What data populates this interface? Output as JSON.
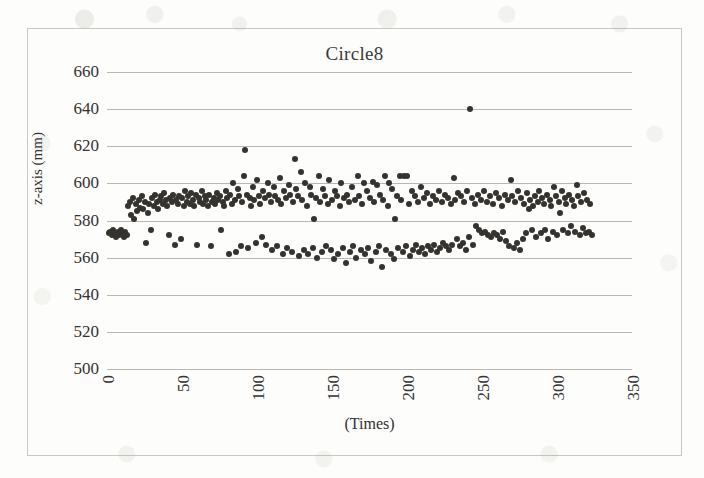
{
  "chart_data": {
    "type": "scatter",
    "title": "Circle8",
    "xlabel": "(Times)",
    "ylabel": "z-axis (mm)",
    "xlim": [
      0,
      350
    ],
    "ylim": [
      500,
      660
    ],
    "xticks": [
      0,
      50,
      100,
      150,
      200,
      250,
      300,
      350
    ],
    "yticks": [
      500,
      520,
      540,
      560,
      580,
      600,
      620,
      640,
      660
    ],
    "grid": "horizontal",
    "legend": "none",
    "marker_color": "#35332f",
    "series": [
      {
        "name": "z-axis measurement",
        "points": [
          [
            1,
            573
          ],
          [
            2,
            574
          ],
          [
            3,
            572
          ],
          [
            4,
            575
          ],
          [
            5,
            573
          ],
          [
            6,
            571
          ],
          [
            7,
            574
          ],
          [
            8,
            572
          ],
          [
            9,
            575
          ],
          [
            10,
            573
          ],
          [
            11,
            571
          ],
          [
            12,
            574
          ],
          [
            13,
            572
          ],
          [
            14,
            588
          ],
          [
            15,
            590
          ],
          [
            16,
            583
          ],
          [
            17,
            592
          ],
          [
            18,
            581
          ],
          [
            19,
            589
          ],
          [
            20,
            585
          ],
          [
            21,
            591
          ],
          [
            22,
            587
          ],
          [
            23,
            593
          ],
          [
            24,
            586
          ],
          [
            25,
            590
          ],
          [
            26,
            568
          ],
          [
            27,
            584
          ],
          [
            28,
            589
          ],
          [
            29,
            575
          ],
          [
            30,
            592
          ],
          [
            31,
            588
          ],
          [
            32,
            594
          ],
          [
            33,
            590
          ],
          [
            34,
            586
          ],
          [
            35,
            591
          ],
          [
            36,
            593
          ],
          [
            37,
            589
          ],
          [
            38,
            595
          ],
          [
            39,
            591
          ],
          [
            40,
            588
          ],
          [
            41,
            572
          ],
          [
            42,
            592
          ],
          [
            43,
            590
          ],
          [
            44,
            594
          ],
          [
            45,
            567
          ],
          [
            46,
            591
          ],
          [
            47,
            589
          ],
          [
            48,
            593
          ],
          [
            49,
            570
          ],
          [
            50,
            592
          ],
          [
            51,
            588
          ],
          [
            52,
            596
          ],
          [
            53,
            590
          ],
          [
            54,
            593
          ],
          [
            55,
            589
          ],
          [
            56,
            595
          ],
          [
            57,
            591
          ],
          [
            58,
            588
          ],
          [
            59,
            594
          ],
          [
            60,
            567
          ],
          [
            61,
            592
          ],
          [
            62,
            590
          ],
          [
            63,
            596
          ],
          [
            64,
            589
          ],
          [
            65,
            593
          ],
          [
            66,
            591
          ],
          [
            67,
            588
          ],
          [
            68,
            594
          ],
          [
            69,
            566
          ],
          [
            70,
            590
          ],
          [
            71,
            592
          ],
          [
            72,
            589
          ],
          [
            73,
            595
          ],
          [
            74,
            591
          ],
          [
            75,
            593
          ],
          [
            76,
            575
          ],
          [
            77,
            590
          ],
          [
            78,
            588
          ],
          [
            79,
            596
          ],
          [
            80,
            592
          ],
          [
            81,
            562
          ],
          [
            82,
            594
          ],
          [
            83,
            589
          ],
          [
            84,
            600
          ],
          [
            85,
            591
          ],
          [
            86,
            563
          ],
          [
            87,
            597
          ],
          [
            88,
            593
          ],
          [
            89,
            566
          ],
          [
            90,
            590
          ],
          [
            91,
            604
          ],
          [
            92,
            618
          ],
          [
            93,
            594
          ],
          [
            94,
            565
          ],
          [
            95,
            592
          ],
          [
            96,
            588
          ],
          [
            97,
            598
          ],
          [
            98,
            591
          ],
          [
            99,
            568
          ],
          [
            100,
            602
          ],
          [
            101,
            593
          ],
          [
            102,
            589
          ],
          [
            103,
            571
          ],
          [
            104,
            596
          ],
          [
            105,
            592
          ],
          [
            106,
            567
          ],
          [
            107,
            600
          ],
          [
            108,
            594
          ],
          [
            109,
            590
          ],
          [
            110,
            564
          ],
          [
            111,
            598
          ],
          [
            112,
            593
          ],
          [
            113,
            566
          ],
          [
            114,
            591
          ],
          [
            115,
            603
          ],
          [
            116,
            589
          ],
          [
            117,
            562
          ],
          [
            118,
            596
          ],
          [
            119,
            592
          ],
          [
            120,
            565
          ],
          [
            121,
            599
          ],
          [
            122,
            594
          ],
          [
            123,
            563
          ],
          [
            124,
            590
          ],
          [
            125,
            613
          ],
          [
            126,
            597
          ],
          [
            127,
            593
          ],
          [
            128,
            561
          ],
          [
            129,
            606
          ],
          [
            130,
            591
          ],
          [
            131,
            564
          ],
          [
            132,
            600
          ],
          [
            133,
            588
          ],
          [
            134,
            562
          ],
          [
            135,
            598
          ],
          [
            136,
            594
          ],
          [
            137,
            565
          ],
          [
            138,
            581
          ],
          [
            139,
            592
          ],
          [
            140,
            560
          ],
          [
            141,
            604
          ],
          [
            142,
            590
          ],
          [
            143,
            563
          ],
          [
            144,
            597
          ],
          [
            145,
            593
          ],
          [
            146,
            566
          ],
          [
            147,
            589
          ],
          [
            148,
            602
          ],
          [
            149,
            564
          ],
          [
            150,
            591
          ],
          [
            151,
            559
          ],
          [
            152,
            596
          ],
          [
            153,
            593
          ],
          [
            154,
            562
          ],
          [
            155,
            588
          ],
          [
            156,
            600
          ],
          [
            157,
            565
          ],
          [
            158,
            592
          ],
          [
            159,
            557
          ],
          [
            160,
            594
          ],
          [
            161,
            590
          ],
          [
            162,
            563
          ],
          [
            163,
            598
          ],
          [
            164,
            566
          ],
          [
            165,
            591
          ],
          [
            166,
            560
          ],
          [
            167,
            604
          ],
          [
            168,
            593
          ],
          [
            169,
            564
          ],
          [
            170,
            589
          ],
          [
            171,
            600
          ],
          [
            172,
            562
          ],
          [
            173,
            596
          ],
          [
            174,
            565
          ],
          [
            175,
            592
          ],
          [
            176,
            558
          ],
          [
            177,
            601
          ],
          [
            178,
            590
          ],
          [
            179,
            563
          ],
          [
            180,
            599
          ],
          [
            181,
            566
          ],
          [
            182,
            594
          ],
          [
            183,
            555
          ],
          [
            184,
            591
          ],
          [
            185,
            604
          ],
          [
            186,
            564
          ],
          [
            187,
            588
          ],
          [
            188,
            600
          ],
          [
            189,
            562
          ],
          [
            190,
            597
          ],
          [
            191,
            559
          ],
          [
            192,
            581
          ],
          [
            193,
            593
          ],
          [
            194,
            565
          ],
          [
            195,
            604
          ],
          [
            196,
            591
          ],
          [
            197,
            563
          ],
          [
            198,
            604
          ],
          [
            199,
            566
          ],
          [
            200,
            604
          ],
          [
            201,
            589
          ],
          [
            202,
            561
          ],
          [
            203,
            596
          ],
          [
            204,
            564
          ],
          [
            205,
            593
          ],
          [
            206,
            567
          ],
          [
            207,
            590
          ],
          [
            208,
            563
          ],
          [
            209,
            598
          ],
          [
            210,
            565
          ],
          [
            211,
            592
          ],
          [
            212,
            562
          ],
          [
            213,
            595
          ],
          [
            214,
            566
          ],
          [
            215,
            589
          ],
          [
            216,
            564
          ],
          [
            217,
            593
          ],
          [
            218,
            567
          ],
          [
            219,
            591
          ],
          [
            220,
            563
          ],
          [
            221,
            596
          ],
          [
            222,
            565
          ],
          [
            223,
            590
          ],
          [
            224,
            568
          ],
          [
            225,
            594
          ],
          [
            226,
            566
          ],
          [
            227,
            592
          ],
          [
            228,
            564
          ],
          [
            229,
            589
          ],
          [
            230,
            567
          ],
          [
            231,
            603
          ],
          [
            232,
            591
          ],
          [
            233,
            570
          ],
          [
            234,
            595
          ],
          [
            235,
            566
          ],
          [
            236,
            593
          ],
          [
            237,
            568
          ],
          [
            238,
            590
          ],
          [
            239,
            564
          ],
          [
            240,
            596
          ],
          [
            241,
            571
          ],
          [
            242,
            640
          ],
          [
            243,
            592
          ],
          [
            244,
            567
          ],
          [
            245,
            589
          ],
          [
            246,
            577
          ],
          [
            247,
            594
          ],
          [
            248,
            575
          ],
          [
            249,
            591
          ],
          [
            250,
            573
          ],
          [
            251,
            596
          ],
          [
            252,
            574
          ],
          [
            253,
            590
          ],
          [
            254,
            572
          ],
          [
            255,
            593
          ],
          [
            256,
            571
          ],
          [
            257,
            589
          ],
          [
            258,
            573
          ],
          [
            259,
            595
          ],
          [
            260,
            572
          ],
          [
            261,
            592
          ],
          [
            262,
            570
          ],
          [
            263,
            588
          ],
          [
            264,
            574
          ],
          [
            265,
            594
          ],
          [
            266,
            569
          ],
          [
            267,
            591
          ],
          [
            268,
            566
          ],
          [
            269,
            602
          ],
          [
            270,
            593
          ],
          [
            271,
            565
          ],
          [
            272,
            590
          ],
          [
            273,
            568
          ],
          [
            274,
            596
          ],
          [
            275,
            564
          ],
          [
            276,
            592
          ],
          [
            277,
            570
          ],
          [
            278,
            589
          ],
          [
            279,
            573
          ],
          [
            280,
            595
          ],
          [
            281,
            586
          ],
          [
            282,
            591
          ],
          [
            283,
            575
          ],
          [
            284,
            588
          ],
          [
            285,
            593
          ],
          [
            286,
            571
          ],
          [
            287,
            590
          ],
          [
            288,
            596
          ],
          [
            289,
            573
          ],
          [
            290,
            592
          ],
          [
            291,
            589
          ],
          [
            292,
            575
          ],
          [
            293,
            594
          ],
          [
            294,
            570
          ],
          [
            295,
            591
          ],
          [
            296,
            588
          ],
          [
            297,
            574
          ],
          [
            298,
            598
          ],
          [
            299,
            593
          ],
          [
            300,
            572
          ],
          [
            301,
            590
          ],
          [
            302,
            584
          ],
          [
            303,
            596
          ],
          [
            304,
            575
          ],
          [
            305,
            592
          ],
          [
            306,
            589
          ],
          [
            307,
            573
          ],
          [
            308,
            594
          ],
          [
            309,
            577
          ],
          [
            310,
            591
          ],
          [
            311,
            588
          ],
          [
            312,
            574
          ],
          [
            313,
            599
          ],
          [
            314,
            593
          ],
          [
            315,
            572
          ],
          [
            316,
            590
          ],
          [
            317,
            576
          ],
          [
            318,
            595
          ],
          [
            319,
            573
          ],
          [
            320,
            591
          ],
          [
            321,
            574
          ],
          [
            322,
            589
          ],
          [
            323,
            572
          ]
        ]
      }
    ]
  }
}
